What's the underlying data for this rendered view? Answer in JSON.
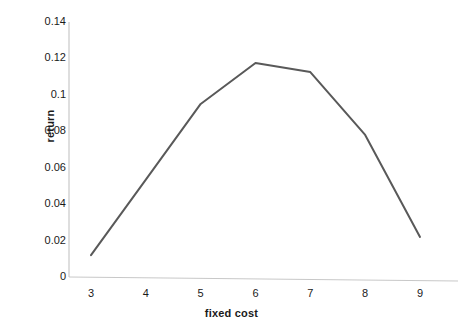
{
  "chart_data": {
    "type": "line",
    "title": "",
    "subtitle": "",
    "xlabel": "fixed cost",
    "ylabel": "return",
    "x": [
      3,
      4,
      5,
      6,
      7,
      8,
      9
    ],
    "categories": [
      "3",
      "4",
      "5",
      "6",
      "7",
      "8",
      "9"
    ],
    "values": [
      0.012,
      0.0535,
      0.095,
      0.1175,
      0.1125,
      0.078,
      0.022
    ],
    "series": [
      {
        "name": "return",
        "values": [
          0.012,
          0.0535,
          0.095,
          0.1175,
          0.1125,
          0.078,
          0.022
        ]
      }
    ],
    "xlim": [
      3,
      9
    ],
    "ylim": [
      0,
      0.14
    ],
    "y_ticks": [
      0,
      0.02,
      0.04,
      0.06,
      0.08,
      0.1,
      0.12,
      0.14
    ],
    "y_tick_labels": [
      "0",
      "0.02",
      "0.04",
      "0.06",
      "0.08",
      "0.1",
      "0.12",
      "0.14"
    ],
    "x_ticks": [
      3,
      4,
      5,
      6,
      7,
      8,
      9
    ],
    "x_tick_labels": [
      "3",
      "4",
      "5",
      "6",
      "7",
      "8",
      "9"
    ],
    "grid": false,
    "legend": false,
    "legend_position": "none",
    "annotations": [],
    "colors": {
      "line": "#595959",
      "axis": "#c8c8c8",
      "text": "#1a1a1a",
      "background": "#ffffff"
    },
    "line_width": 2
  },
  "axes": {
    "y_title": "return",
    "x_title": "fixed cost"
  }
}
